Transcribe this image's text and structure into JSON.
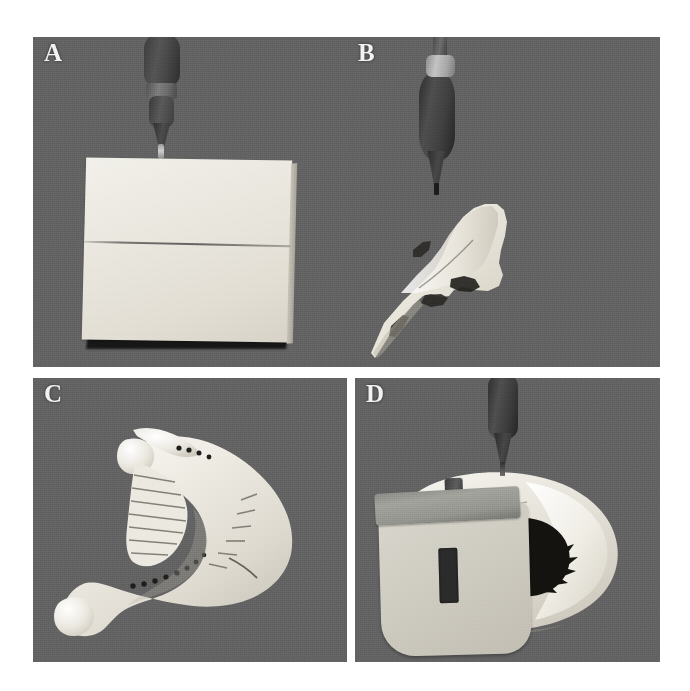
{
  "figure": {
    "caption_letters": [
      "A",
      "B",
      "C",
      "D"
    ],
    "background_color": "#ffffff",
    "panel_background_color": "#636363",
    "panel_label_color": "#f2f2f2"
  },
  "panels": [
    {
      "id": "A",
      "label": "A",
      "description": "Rectangular white bone-substitute block on gray background with a handpiece bur positioned above it; a horizontal osteotomy cut line crosses the block.",
      "specimen": "rectangular-bone-block",
      "specimen_color": "#eae7df",
      "tool": "surgical-bur-handpiece",
      "tool_color": "#3c3c3c",
      "cut_line": "horizontal-osteotomy-line"
    },
    {
      "id": "B",
      "label": "B",
      "description": "Irregular white bone graft fragment on gray background with an elongated handpiece bur above it; a fine cut line traverses the fragment.",
      "specimen": "irregular-bone-graft-fragment",
      "specimen_color": "#f0ede5",
      "tool": "surgical-bur-handpiece",
      "tool_color": "#2c2c2c",
      "cut_line": "osteotomy-line"
    },
    {
      "id": "C",
      "label": "C",
      "description": "Mandible model in occlusal view showing the dental arch, ramus and condyle, with drilled socket holes and surface striations marking the planned osteotomy.",
      "specimen": "mandible-model",
      "specimen_color": "#ece9e1",
      "features": [
        "dental-arch",
        "ramus",
        "condyle",
        "socket-holes",
        "osteotomy-striations",
        "cut-line"
      ]
    },
    {
      "id": "D",
      "label": "D",
      "description": "Mandible model fitted with a light gray surgical cutting guide/splint having a slot window, with a bur positioned above the guide.",
      "specimen": "mandible-model-with-surgical-guide",
      "specimen_color": "#e3dfd5",
      "guide_color": "#d9d6cd",
      "guide_bar_color": "#9a9a94",
      "guide_slot_color": "#2b2b2b",
      "tool": "surgical-bur-handpiece",
      "tool_color": "#2e2e2e"
    }
  ]
}
